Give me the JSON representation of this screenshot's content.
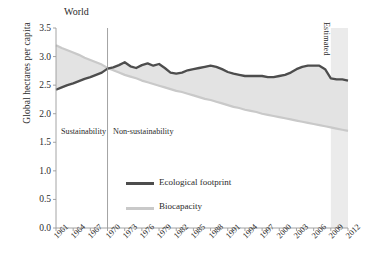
{
  "figure": {
    "title": "World",
    "ylabel": "Global hectares per capita",
    "estimated_label": "Estimated",
    "zone_left_label": "Sustainability",
    "zone_right_label": "Non-sustainability"
  },
  "legend": {
    "items": [
      {
        "label": "Ecological footprint",
        "color": "#4d4d4d"
      },
      {
        "label": "Biocapacity",
        "color": "#c9c9c9"
      }
    ]
  },
  "colors": {
    "footprint_line": "#4d4d4d",
    "biocapacity_line": "#c9c9c9",
    "band_fill": "#e3e3e3",
    "axis": "#9a9a9a",
    "divider": "#9a9a9a",
    "estimated_band": "#ebebeb",
    "text": "#2b2b2b"
  },
  "axes": {
    "y_ticks": [
      "0.0",
      "0.5",
      "1.0",
      "1.5",
      "2.0",
      "2.5",
      "3.0",
      "3.5"
    ],
    "y_tick_values": [
      0.0,
      0.5,
      1.0,
      1.5,
      2.0,
      2.5,
      3.0,
      3.5
    ],
    "ylim": [
      0.0,
      3.5
    ],
    "x_ticks": [
      "1961",
      "1964",
      "1967",
      "1970",
      "1973",
      "1976",
      "1979",
      "1982",
      "1985",
      "1988",
      "1991",
      "1994",
      "1997",
      "2000",
      "2003",
      "2006",
      "2009",
      "2012"
    ],
    "x_tick_values": [
      1961,
      1964,
      1967,
      1970,
      1973,
      1976,
      1979,
      1982,
      1985,
      1988,
      1991,
      1994,
      1997,
      2000,
      2003,
      2006,
      2009,
      2012
    ],
    "xlim": [
      1961,
      2012
    ],
    "divider_year": 1970,
    "estimated_start_year": 2009,
    "grid": false
  },
  "chart_data": {
    "type": "area",
    "title": "World",
    "xlabel": "",
    "ylabel": "Global hectares per capita",
    "ylim": [
      0.0,
      3.5
    ],
    "xlim": [
      1961,
      2012
    ],
    "grid": false,
    "legend_position": "center-bottom-inside",
    "x": [
      1961,
      1962,
      1963,
      1964,
      1965,
      1966,
      1967,
      1968,
      1969,
      1970,
      1971,
      1972,
      1973,
      1974,
      1975,
      1976,
      1977,
      1978,
      1979,
      1980,
      1981,
      1982,
      1983,
      1984,
      1985,
      1986,
      1987,
      1988,
      1989,
      1990,
      1991,
      1992,
      1993,
      1994,
      1995,
      1996,
      1997,
      1998,
      1999,
      2000,
      2001,
      2002,
      2003,
      2004,
      2005,
      2006,
      2007,
      2008,
      2009,
      2010,
      2011,
      2012
    ],
    "series": [
      {
        "name": "Ecological footprint",
        "color": "#4d4d4d",
        "values": [
          2.42,
          2.46,
          2.5,
          2.53,
          2.57,
          2.61,
          2.64,
          2.68,
          2.72,
          2.79,
          2.81,
          2.85,
          2.9,
          2.83,
          2.8,
          2.85,
          2.88,
          2.84,
          2.87,
          2.8,
          2.72,
          2.7,
          2.72,
          2.76,
          2.78,
          2.8,
          2.82,
          2.84,
          2.82,
          2.78,
          2.73,
          2.7,
          2.68,
          2.66,
          2.66,
          2.66,
          2.66,
          2.64,
          2.64,
          2.66,
          2.68,
          2.72,
          2.78,
          2.82,
          2.84,
          2.84,
          2.84,
          2.78,
          2.62,
          2.6,
          2.6,
          2.58
        ]
      },
      {
        "name": "Biocapacity",
        "color": "#c9c9c9",
        "values": [
          3.2,
          3.15,
          3.11,
          3.07,
          3.03,
          2.98,
          2.94,
          2.9,
          2.86,
          2.8,
          2.76,
          2.72,
          2.68,
          2.65,
          2.62,
          2.58,
          2.55,
          2.52,
          2.49,
          2.46,
          2.43,
          2.4,
          2.38,
          2.35,
          2.32,
          2.29,
          2.26,
          2.24,
          2.21,
          2.18,
          2.15,
          2.12,
          2.1,
          2.07,
          2.05,
          2.03,
          2.0,
          1.98,
          1.96,
          1.94,
          1.92,
          1.9,
          1.88,
          1.86,
          1.84,
          1.82,
          1.8,
          1.78,
          1.76,
          1.74,
          1.72,
          1.7
        ]
      }
    ],
    "annotations": [
      {
        "text": "World",
        "type": "title"
      },
      {
        "text": "Sustainability",
        "type": "zone",
        "x_range": [
          1961,
          1970
        ]
      },
      {
        "text": "Non-sustainability",
        "type": "zone",
        "x_range": [
          1970,
          2012
        ]
      },
      {
        "text": "Estimated",
        "type": "region",
        "x_range": [
          2009,
          2012
        ],
        "rotated": true
      }
    ]
  }
}
